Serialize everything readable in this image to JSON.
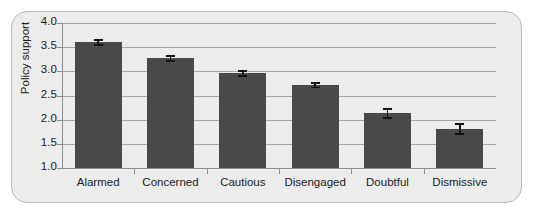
{
  "chart_data": {
    "type": "bar",
    "title": "",
    "subtitle": "",
    "xlabel": "",
    "ylabel": "Policy support",
    "categories": [
      "Alarmed",
      "Concerned",
      "Cautious",
      "Disengaged",
      "Doubtful",
      "Dismissive"
    ],
    "values": [
      3.6,
      3.27,
      2.96,
      2.71,
      2.13,
      1.81
    ],
    "errors": [
      0.07,
      0.07,
      0.07,
      0.06,
      0.11,
      0.12
    ],
    "ylim": [
      1.0,
      4.0
    ],
    "yticks": [
      1.0,
      1.5,
      2.0,
      2.5,
      3.0,
      3.5,
      4.0
    ],
    "ytick_labels": [
      "1.0",
      "1.5",
      "2.0",
      "2.5",
      "3.0",
      "3.5",
      "4.0"
    ],
    "grid": true,
    "grid_axis": "y",
    "legend": false,
    "legend_position": "none",
    "bar_color": "#494949",
    "error_color": "#111111",
    "plot_background": "#ececec",
    "grid_color": "#a8a8a8",
    "axis_color": "#8d8d8d",
    "frame_color": "#b9b9b9",
    "page_background": "#ffffff"
  }
}
